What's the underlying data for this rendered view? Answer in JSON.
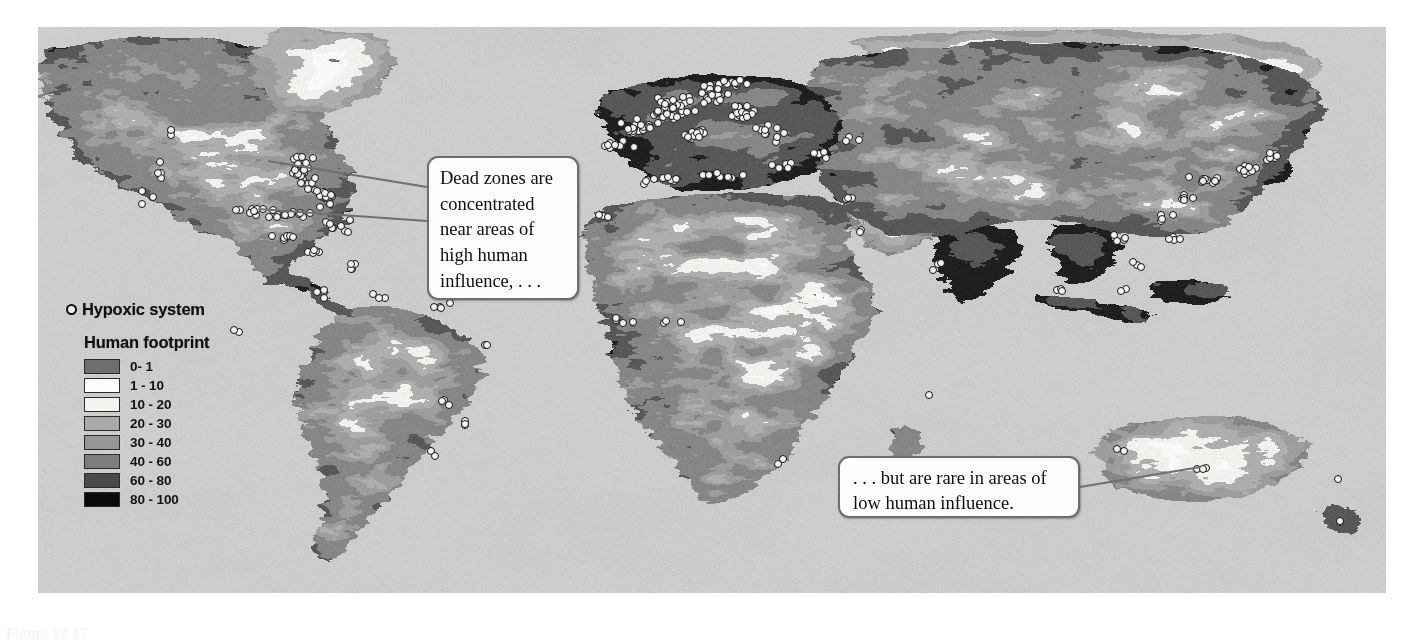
{
  "figure": {
    "type": "thematic-world-map",
    "projection": "world"
  },
  "legend": {
    "hypoxic": {
      "symbol_name": "hypoxic-system-marker",
      "label": "Hypoxic system"
    },
    "footprint_title": "Human footprint",
    "footprint_classes": [
      {
        "label": "0- 1",
        "color": "#6e6e6e"
      },
      {
        "label": "1 - 10",
        "color": "#fdfdfd"
      },
      {
        "label": "10 - 20",
        "color": "#f4f4f0"
      },
      {
        "label": "20 - 30",
        "color": "#a9a9a9"
      },
      {
        "label": "30 - 40",
        "color": "#969696"
      },
      {
        "label": "40 - 60",
        "color": "#7d7d7d"
      },
      {
        "label": "60 - 80",
        "color": "#4a4a4a"
      },
      {
        "label": "80 - 100",
        "color": "#0b0b0b"
      }
    ]
  },
  "callouts": [
    {
      "name": "dead-zones-callout",
      "text": "Dead zones are concentrated near areas of high human influence, . . ."
    },
    {
      "name": "low-influence-callout",
      "text": ". . . but are rare in areas of low human influence."
    }
  ],
  "caption": {
    "figure_number": "Figure 12.17",
    "text": "Figure 12.17"
  },
  "colors": {
    "ocean": "#cbcbcb",
    "background": "#ffffff",
    "marker_fill": "#f3f3f1",
    "marker_stroke": "#121212",
    "callout_border": "#6d6d6d",
    "leader_line": "#6f6f6f"
  },
  "chart_data": {
    "type": "map",
    "legend_position": "left",
    "value_range": [
      0,
      100
    ],
    "units": "human footprint index",
    "classes": [
      "0- 1",
      "1 - 10",
      "10 - 20",
      "20 - 30",
      "30 - 40",
      "40 - 60",
      "60 - 80",
      "80 - 100"
    ],
    "marker_series": {
      "name": "Hypoxic system",
      "count_approx": 410,
      "regions": [
        {
          "region": "US East Coast / Gulf of Mexico",
          "approx_count": 95
        },
        {
          "region": "Northern Europe / Baltic / North Sea",
          "approx_count": 150
        },
        {
          "region": "Mediterranean / Black Sea",
          "approx_count": 35
        },
        {
          "region": "East Asia / Japan / China",
          "approx_count": 40
        },
        {
          "region": "South America coasts",
          "approx_count": 12
        },
        {
          "region": "Africa coasts",
          "approx_count": 10
        },
        {
          "region": "Australia / New Zealand",
          "approx_count": 8
        },
        {
          "region": "US West Coast",
          "approx_count": 14
        }
      ]
    }
  }
}
